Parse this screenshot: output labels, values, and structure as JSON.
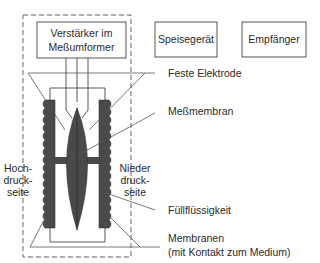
{
  "boxes": {
    "amplifier_line1": "Verstärker im",
    "amplifier_line2": "Meßumformer",
    "power_supply": "Speisegerät",
    "receiver": "Empfänger"
  },
  "labels": {
    "fixed_electrode": "Feste Elektrode",
    "measuring_membrane": "Meßmembran",
    "fill_fluid": "Füllflüssigkeit",
    "membranes_line1": "Membranen",
    "membranes_line2": "(mit Kontakt zum Medium)",
    "high_pressure_line1": "Hoch-",
    "high_pressure_line2": "druck-",
    "high_pressure_line3": "seite",
    "low_pressure_line1": "Nieder",
    "low_pressure_line2": "druck-",
    "low_pressure_line3": "seite"
  },
  "colors": {
    "stroke": "#3a3a3a",
    "fill_dark": "#4a4a4a",
    "background": "#ffffff"
  }
}
